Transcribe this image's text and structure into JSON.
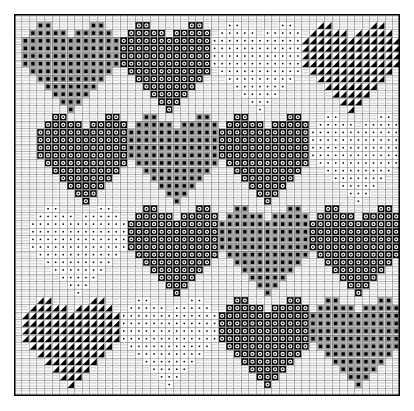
{
  "document": {
    "title": "Heart Motif Cross-Stitch Chart",
    "type": "needlepoint-pattern-chart",
    "description": "Square counted-thread charting grid filled with sixteen heart motifs arranged in a four-by-four block layout, each heart rendered in one of four stitch symbols."
  },
  "chart_data": {
    "type": "heatmap",
    "subtitle": "",
    "xlabel": "",
    "ylabel": "",
    "grid": true,
    "legend_position": "none",
    "grid_columns": 51,
    "grid_rows": 50,
    "cell_size_px": 7.56,
    "x": [],
    "categories": [],
    "values": [],
    "axis_ranges": {
      "x": [
        0,
        51
      ],
      "y": [
        0,
        50
      ]
    },
    "colors": {
      "background": "#ffffff",
      "thin_grid_line": "#6e6e6e",
      "thick_grid_line": "#1a1a1a",
      "symbol_fill": "#000000",
      "symbol_halo": "#9a9a9a",
      "frame_border": "#000000"
    },
    "symbols": [
      {
        "key": "solid",
        "name": "filled-square-symbol",
        "label": "Full cross stitch",
        "glyph": "filled square",
        "color": "#000000"
      },
      {
        "key": "circle",
        "name": "open-circle-symbol",
        "label": "Open circle stitch",
        "glyph": "ring / donut",
        "color": "#000000"
      },
      {
        "key": "dot",
        "name": "small-dot-symbol",
        "label": "Small dot stitch",
        "glyph": "tiny dot",
        "color": "#000000"
      },
      {
        "key": "tri",
        "name": "half-triangle-symbol",
        "label": "Half / quarter stitch",
        "glyph": "upper-right triangle",
        "color": "#000000"
      }
    ],
    "heart_shape_rows": [
      "0011000001100",
      "0111110111110",
      "1111111111111",
      "1111111111111",
      "1111111111111",
      "1111111111111",
      "0111111111110",
      "0011111111100",
      "0001111111000",
      "0000111110000",
      "0000011100000",
      "0000001000000"
    ],
    "heart_grid": {
      "columns": 4,
      "rows": 4,
      "cell_origin_col": [
        1,
        14,
        27,
        39
      ],
      "cell_origin_row": [
        1,
        13,
        25,
        37
      ],
      "motifs": [
        [
          {
            "symbol": "solid",
            "name": "heart-r1c1",
            "col": 1,
            "row": 1
          },
          {
            "symbol": "circle",
            "name": "heart-r1c2",
            "col": 14,
            "row": 1
          },
          {
            "symbol": "dot",
            "name": "heart-r1c3",
            "col": 26,
            "row": 1
          },
          {
            "symbol": "tri",
            "name": "heart-r1c4",
            "col": 38,
            "row": 1
          }
        ],
        [
          {
            "symbol": "circle",
            "name": "heart-r2c1",
            "col": 3,
            "row": 13
          },
          {
            "symbol": "solid",
            "name": "heart-r2c2",
            "col": 15,
            "row": 13
          },
          {
            "symbol": "circle",
            "name": "heart-r2c3",
            "col": 27,
            "row": 13
          },
          {
            "symbol": "dot",
            "name": "heart-r2c4",
            "col": 39,
            "row": 13
          }
        ],
        [
          {
            "symbol": "dot",
            "name": "heart-r3c1",
            "col": 2,
            "row": 25
          },
          {
            "symbol": "circle",
            "name": "heart-r3c2",
            "col": 15,
            "row": 25
          },
          {
            "symbol": "solid",
            "name": "heart-r3c3",
            "col": 27,
            "row": 25
          },
          {
            "symbol": "circle",
            "name": "heart-r3c4",
            "col": 39,
            "row": 25
          }
        ],
        [
          {
            "symbol": "tri",
            "name": "heart-r4c1",
            "col": 1,
            "row": 37
          },
          {
            "symbol": "dot",
            "name": "heart-r4c2",
            "col": 14,
            "row": 37
          },
          {
            "symbol": "circle",
            "name": "heart-r4c3",
            "col": 27,
            "row": 37
          },
          {
            "symbol": "solid",
            "name": "heart-r4c4",
            "col": 39,
            "row": 37
          }
        ]
      ]
    }
  }
}
